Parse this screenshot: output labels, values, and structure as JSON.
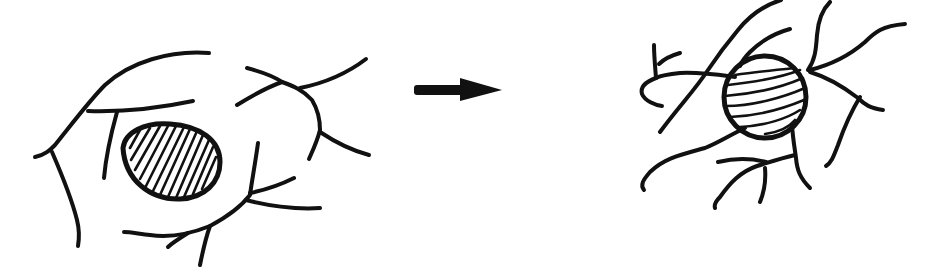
{
  "diagram": {
    "panels": [
      {
        "id": "before",
        "label": "",
        "shape": "large oval body with diagonal hatching, surrounded by long thin branching processes"
      },
      {
        "id": "after",
        "label": "",
        "shape": "smaller round body with horizontal curved hatching, surrounded by thicker, shorter, more tangled branching processes"
      }
    ],
    "arrow": {
      "direction": "right",
      "meaning": "transformation",
      "color": "#111111"
    },
    "colors": {
      "stroke": "#111111",
      "background": "#ffffff"
    }
  }
}
